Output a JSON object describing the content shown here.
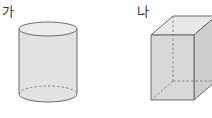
{
  "figures": [
    {
      "label": "가",
      "shape": "cylinder"
    },
    {
      "label": "나",
      "shape": "rectangular-prism"
    }
  ],
  "colors": {
    "stroke": "#6b6b6b",
    "fill_light": "#e6e6e6",
    "fill_side": "#d9d9d9",
    "fill_top": "#e9e9e9",
    "fill_right": "#cfcfcf",
    "hidden_line": "#7a7a7a"
  }
}
